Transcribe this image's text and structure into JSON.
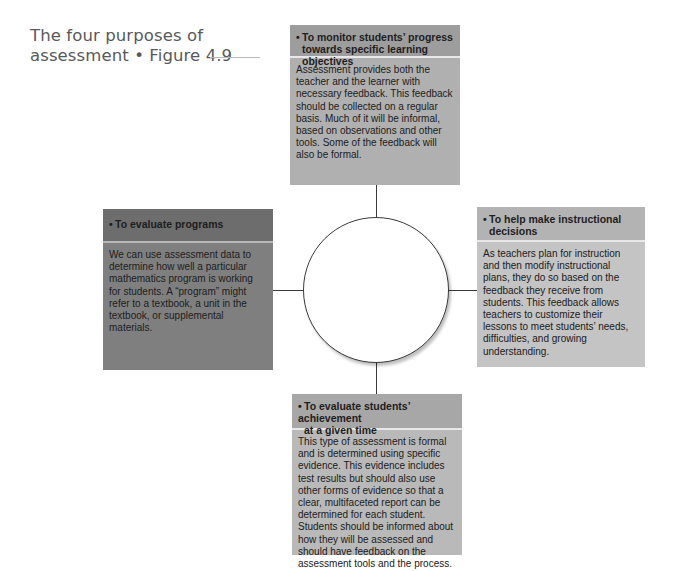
{
  "title": {
    "line1": "The four purposes of",
    "line2": "assessment  •  Figure 4.9"
  },
  "boxes": {
    "top": {
      "heading_line1": "To monitor students’ progress",
      "heading_line2": "towards specific learning objectives",
      "body": "Assessment provides both the teacher and the learner with necessary feedback. This feedback should be collected on a regular basis. Much of it will be informal, based on observations and other tools. Some of the feedback will also be formal.",
      "header_color": "#9d9d9d",
      "body_color": "#b0b0b0"
    },
    "left": {
      "heading_line1": "To evaluate programs",
      "body": "We can use assessment data to determine how well a particular mathematics program is working for students. A “program” might refer to a textbook, a unit in the textbook, or supplemental materials.",
      "header_color": "#6d6d6d",
      "body_color": "#7f7f7f"
    },
    "right": {
      "heading_line1": "To help make instructional",
      "heading_line2": "decisions",
      "body": "As teachers plan for instruction and then modify instructional plans, they do so based on the feedback they receive from students. This feedback allows teachers to customize their lessons to meet students’ needs, difficulties, and growing understanding.",
      "header_color": "#b3b3b3",
      "body_color": "#c4c4c4"
    },
    "bottom": {
      "heading_line1": "To evaluate students’ achievement",
      "heading_line2": "at a given time",
      "body": "This type of assessment is formal and is determined using specific evidence. This evidence includes test results but should also use other forms of evidence so that a clear, multifaceted report can be determined for each student. Students should be informed about how they will be assessed and should have feedback on the assessment tools and the process.",
      "header_color": "#a7a7a7",
      "body_color": "#b9b9b9"
    }
  },
  "bullet": "•",
  "center": {
    "shape": "circle",
    "label": ""
  }
}
